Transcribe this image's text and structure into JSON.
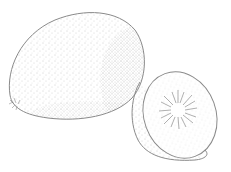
{
  "image": {
    "subject": "kiwi fruit sketch",
    "style": "pencil line drawing with stippling",
    "elements": [
      "whole kiwi",
      "halved kiwi"
    ],
    "colors": {
      "background": "#ffffff",
      "line": "#8a8a8a",
      "stipple": "#9a9a9a",
      "seed_rays": "#7a7a7a"
    }
  }
}
